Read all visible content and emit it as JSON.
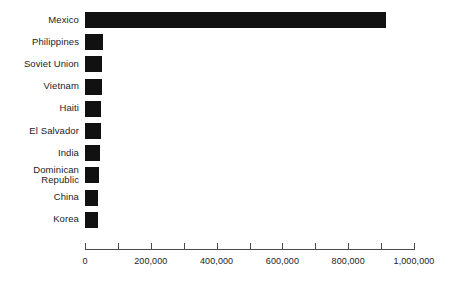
{
  "chart_data": {
    "type": "bar",
    "orientation": "horizontal",
    "title": "",
    "subtitle": "",
    "xlabel": "",
    "ylabel": "",
    "categories": [
      "Mexico",
      "Philippines",
      "Soviet Union",
      "Vietnam",
      "Haiti",
      "El Salvador",
      "India",
      "Dominican Republic",
      "China",
      "Korea"
    ],
    "values": [
      915000,
      54000,
      52000,
      51000,
      50000,
      48000,
      45000,
      42000,
      39000,
      38000
    ],
    "xlim": [
      0,
      1000000
    ],
    "xticks": [
      0,
      100000,
      200000,
      300000,
      400000,
      500000,
      600000,
      700000,
      800000,
      900000,
      1000000
    ],
    "xtick_labels": [
      "0",
      "",
      "200,000",
      "",
      "400,000",
      "",
      "600,000",
      "",
      "800,000",
      "",
      "1,000,000"
    ],
    "grid": false,
    "legend": null,
    "bar_color": "#111111",
    "axis_color": "#4a4a4a",
    "text_color": "#1c1c1c",
    "background_color": "#ffffff"
  }
}
